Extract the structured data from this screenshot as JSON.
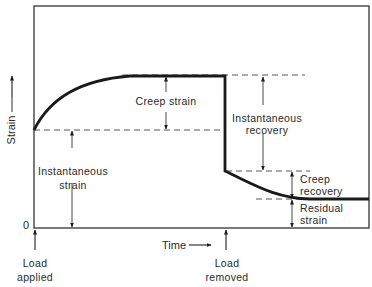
{
  "diagram": {
    "type": "creep strain vs time",
    "y_axis_label": "Strain",
    "x_axis_label": "Time",
    "origin_label": "0",
    "events": [
      {
        "line1": "Load",
        "line2": "applied"
      },
      {
        "line1": "Load",
        "line2": "removed"
      }
    ],
    "annotations": {
      "creep_strain": "Creep strain",
      "instantaneous_strain": {
        "line1": "Instantaneous",
        "line2": "strain"
      },
      "instantaneous_recovery": {
        "line1": "Instantaneous",
        "line2": "recovery"
      },
      "creep_recovery": {
        "line1": "Creep",
        "line2": "recovery"
      },
      "residual_strain": {
        "line1": "Residual",
        "line2": "strain"
      }
    },
    "colors": {
      "line": "#1a1a1a",
      "frame": "#333333",
      "dash": "#444444",
      "text": "#2a2a2a"
    }
  }
}
